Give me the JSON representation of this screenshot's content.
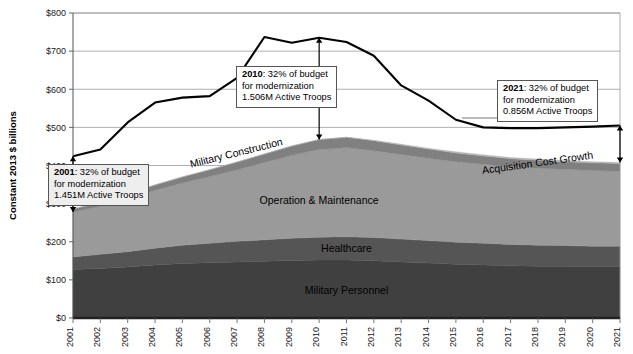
{
  "chart_data": {
    "type": "area",
    "title": "",
    "xlabel": "",
    "ylabel": "Constant 2013 $ billions",
    "ylim": [
      0,
      800
    ],
    "ytick_step": 100,
    "ytick_labels": [
      "$0",
      "$100",
      "$200",
      "$300",
      "$400",
      "$500",
      "$600",
      "$700",
      "$800"
    ],
    "grid": true,
    "legend_position": "in-plot-labels",
    "x": [
      2001,
      2002,
      2003,
      2004,
      2005,
      2006,
      2007,
      2008,
      2009,
      2010,
      2011,
      2012,
      2013,
      2014,
      2015,
      2016,
      2017,
      2018,
      2019,
      2020,
      2021
    ],
    "categories": [
      "2001",
      "2002",
      "2003",
      "2004",
      "2005",
      "2006",
      "2007",
      "2008",
      "2009",
      "2010",
      "2011",
      "2012",
      "2013",
      "2014",
      "2015",
      "2016",
      "2017",
      "2018",
      "2019",
      "2020",
      "2021"
    ],
    "stacked_series": [
      {
        "name": "Military Personnel",
        "color": "#404040",
        "label_x": 2011,
        "label_y": 60,
        "values": [
          127,
          130,
          134,
          139,
          143,
          145,
          147,
          149,
          151,
          152,
          152,
          150,
          147,
          144,
          141,
          139,
          137,
          136,
          136,
          135,
          135
        ]
      },
      {
        "name": "Healthcare",
        "color": "#555555",
        "label_x": 2011,
        "label_y": 170,
        "values": [
          33,
          37,
          40,
          44,
          48,
          51,
          54,
          56,
          58,
          60,
          61,
          61,
          60,
          59,
          58,
          57,
          56,
          55,
          54,
          53,
          53
        ]
      },
      {
        "name": "Operation & Maintenance",
        "color": "#9a9a9a",
        "label_x": 2010,
        "label_y": 300,
        "values": [
          118,
          126,
          140,
          152,
          163,
          175,
          188,
          203,
          218,
          230,
          234,
          228,
          222,
          216,
          211,
          207,
          204,
          202,
          200,
          199,
          197
        ]
      },
      {
        "name": "Military Construction",
        "color": "#808080",
        "label_x": 2007,
        "label_y": 450,
        "values": [
          8,
          10,
          12,
          14,
          16,
          18,
          20,
          22,
          24,
          26,
          27,
          26,
          25,
          24,
          23,
          22,
          21,
          21,
          20,
          20,
          20
        ]
      },
      {
        "name": "Acquisition Cost Growth",
        "color": "#b5b5b5",
        "label_x": 2018,
        "label_y": 430,
        "values": [
          0,
          0,
          0,
          0,
          0,
          0,
          0,
          0,
          0,
          0,
          0,
          1,
          2,
          2,
          3,
          3,
          3,
          3,
          3,
          3,
          3
        ]
      }
    ],
    "total_line": {
      "name": "Total Budget",
      "color": "#000000",
      "values": [
        424,
        442,
        513,
        565,
        578,
        582,
        630,
        737,
        722,
        735,
        724,
        688,
        610,
        570,
        520,
        500,
        498,
        498,
        500,
        502,
        505
      ]
    }
  },
  "axis": {
    "y_title": "Constant 2013 $ billions"
  },
  "callouts": [
    {
      "id": "callout-2001",
      "year_label": "2001",
      "line1_rest": ": 32% of budget",
      "line2": "for modernization",
      "line3": "1.451M Active Troops",
      "arrow_top_value": 424,
      "arrow_bottom_value": 278
    },
    {
      "id": "callout-2010",
      "year_label": "2010",
      "line1_rest": ": 32% of budget",
      "line2": "for modernization",
      "line3": "1.506M Active Troops",
      "arrow_top_value": 735,
      "arrow_bottom_value": 468
    },
    {
      "id": "callout-2021",
      "year_label": "2021",
      "line1_rest": ": 32% of budget",
      "line2": "for modernization",
      "line3": "0.856M Active Troops",
      "arrow_top_value": 505,
      "arrow_bottom_value": 408
    }
  ],
  "band_labels": {
    "military_personnel": "Military Personnel",
    "healthcare": "Healthcare",
    "operation_maintenance": "Operation & Maintenance",
    "military_construction": "Military Construction",
    "acquisition_cost_growth": "Acquisition Cost Growth"
  }
}
